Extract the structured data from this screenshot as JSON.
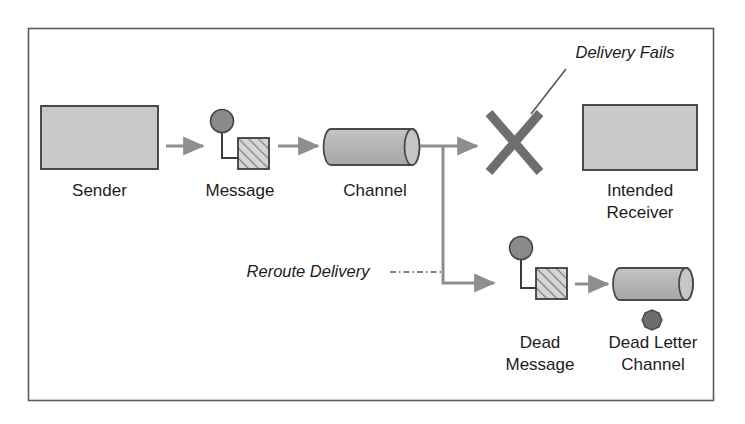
{
  "diagram": {
    "title": "Dead Letter Channel",
    "frame": {
      "border_color": "#555555",
      "background": "#ffffff"
    },
    "palette": {
      "box_fill": "#c9c9c9",
      "box_stroke": "#3a3a3a",
      "cylinder_fill": "#b4b4b4",
      "cylinder_cap_fill": "#c4c4c4",
      "cylinder_stroke": "#4a4a4a",
      "dot_fill": "#7d7d7d",
      "dot_stroke": "#454545",
      "dark_dot_fill": "#666666",
      "hatch_fill": "#d6d6d6",
      "hatch_line": "#7a7a7a",
      "arrow_color": "#8e8e8e",
      "cross_color": "#6e6e6e",
      "leader_color": "#555555",
      "text_color": "#1c1c1c"
    },
    "nodes": [
      {
        "id": "sender",
        "type": "box",
        "label": "Sender",
        "label_lines": [
          "Sender"
        ]
      },
      {
        "id": "message",
        "type": "message-icon",
        "label": "Message",
        "label_lines": [
          "Message"
        ]
      },
      {
        "id": "channel",
        "type": "cylinder",
        "label": "Channel",
        "label_lines": [
          "Channel"
        ]
      },
      {
        "id": "delivery-failure",
        "type": "cross",
        "label": "Delivery Fails",
        "label_lines": [
          "Delivery Fails"
        ]
      },
      {
        "id": "intended-receiver",
        "type": "box",
        "label": "Intended Receiver",
        "label_lines": [
          "Intended",
          "Receiver"
        ]
      },
      {
        "id": "dead-message",
        "type": "message-icon",
        "label": "Dead Message",
        "label_lines": [
          "Dead",
          "Message"
        ]
      },
      {
        "id": "dead-letter-channel",
        "type": "cylinder-with-dot",
        "label": "Dead Letter Channel",
        "label_lines": [
          "Dead Letter",
          "Channel"
        ]
      }
    ],
    "annotations": [
      {
        "id": "delivery-fails",
        "text": "Delivery Fails",
        "style": "italic",
        "leader": "solid-diagonal"
      },
      {
        "id": "reroute-delivery",
        "text": "Reroute Delivery",
        "style": "italic",
        "leader": "dash-dot-horizontal"
      }
    ],
    "flows": [
      {
        "from": "sender",
        "to": "message"
      },
      {
        "from": "message",
        "to": "channel"
      },
      {
        "from": "channel",
        "to": "delivery-failure"
      },
      {
        "from": "channel",
        "to": "dead-message"
      },
      {
        "from": "dead-message",
        "to": "dead-letter-channel"
      }
    ]
  }
}
